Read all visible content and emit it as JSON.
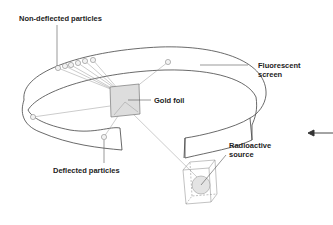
{
  "labels": {
    "non_deflected": "Non-deflected particles",
    "gold_foil": "Gold foil",
    "fluorescent_line1": "Fluorescent",
    "fluorescent_line2": "screen",
    "deflected": "Deflected particles",
    "radioactive_line1": "Radioactive",
    "radioactive_line2": "source"
  },
  "colors": {
    "stroke": "#444444",
    "thin_stroke": "#999999",
    "foil_fill": "#dddddd",
    "source_fill": "#e4e4e4",
    "text": "#222222"
  },
  "icons": {
    "arrow": "left-arrow-icon"
  }
}
